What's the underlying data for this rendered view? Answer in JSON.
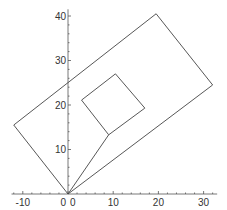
{
  "header": {
    "clipped_text": ""
  },
  "chart_data": {
    "type": "line",
    "title": "",
    "xlabel": "",
    "ylabel": "",
    "xlim": [
      -12.5,
      33
    ],
    "ylim": [
      0,
      41
    ],
    "grid": false,
    "x_ticks": [
      -10,
      0,
      10,
      20,
      30
    ],
    "y_ticks": [
      0,
      10,
      20,
      30,
      40
    ],
    "x_tick_labels": [
      "-10",
      "0",
      "10",
      "20",
      "30"
    ],
    "y_tick_labels": [
      "0",
      "10",
      "20",
      "30",
      "40"
    ],
    "series": [
      {
        "name": "outer-rectangle",
        "closed": true,
        "points": [
          [
            0,
            0
          ],
          [
            -12,
            15.5
          ],
          [
            19.5,
            40.5
          ],
          [
            32,
            24.5
          ]
        ]
      },
      {
        "name": "inner-square",
        "closed": true,
        "points": [
          [
            9,
            13.3
          ],
          [
            17,
            19.3
          ],
          [
            10.5,
            27
          ],
          [
            3,
            21.1
          ]
        ]
      },
      {
        "name": "connector",
        "closed": false,
        "points": [
          [
            0,
            0
          ],
          [
            9,
            13.3
          ]
        ]
      }
    ]
  }
}
